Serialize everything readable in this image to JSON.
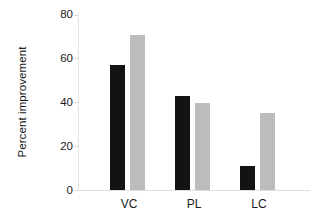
{
  "chart_data": {
    "type": "bar",
    "title": "",
    "subtitle": "",
    "xlabel": "",
    "ylabel": "Percent improvement",
    "categories": [
      "VC",
      "PL",
      "LC"
    ],
    "series": [
      {
        "name": "black",
        "color": "#131313",
        "values": [
          57,
          43,
          11
        ]
      },
      {
        "name": "gray",
        "color": "#bcbcbc",
        "values": [
          71,
          40,
          35
        ]
      }
    ],
    "ylim": [
      0,
      80
    ],
    "yticks": [
      0,
      20,
      40,
      60,
      80
    ],
    "ytick_labels": [
      "0",
      "20",
      "40",
      "60",
      "80"
    ],
    "grid": false,
    "legend": "none",
    "background": "#ffffff"
  },
  "axis": {
    "y_title": "Percent improvement",
    "y_labels": {
      "t0": "0",
      "t20": "20",
      "t40": "40",
      "t60": "60",
      "t80": "80"
    },
    "x_labels": {
      "c0": "VC",
      "c1": "PL",
      "c2": "LC"
    }
  }
}
